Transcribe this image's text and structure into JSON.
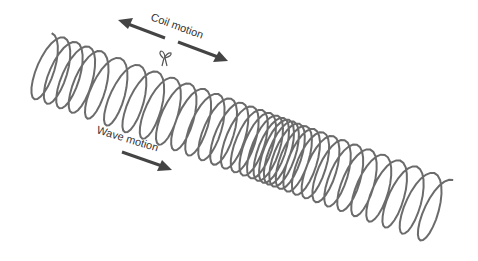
{
  "diagram": {
    "labels": {
      "coil_motion": "Coil motion",
      "wave_motion": "Wave motion"
    },
    "colors": {
      "coil": "#6b6b6b",
      "arrow": "#444444",
      "text": "#333333"
    },
    "spring": {
      "coil_count": 34,
      "compression_region": "center",
      "marker": "ribbon tied on coil"
    }
  }
}
